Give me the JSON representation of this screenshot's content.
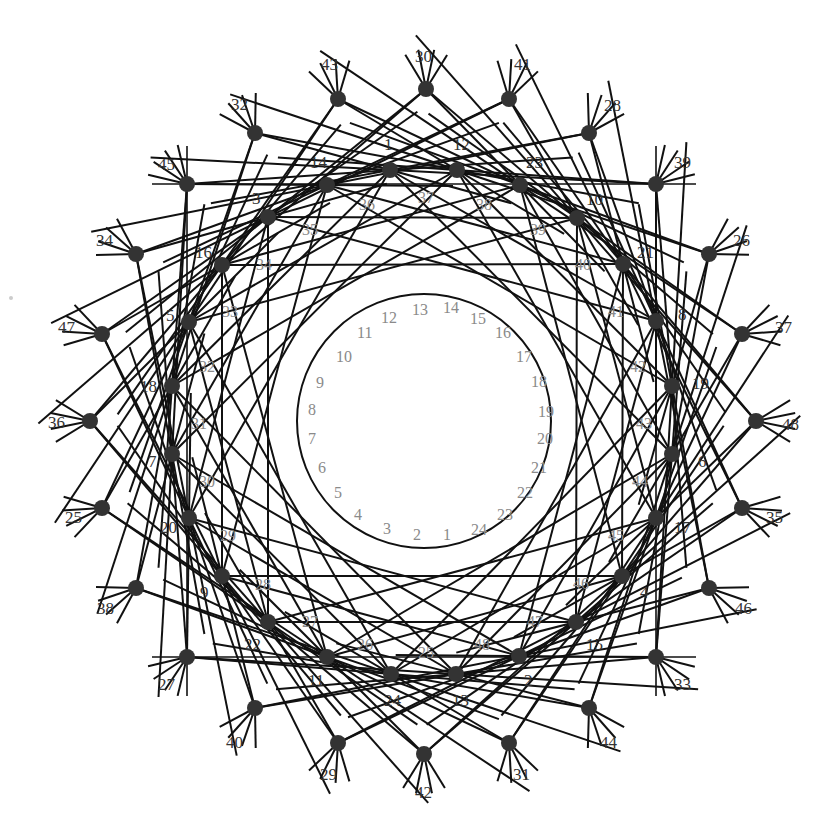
{
  "diagram": {
    "type": "line-arrangement",
    "center": [
      424,
      421
    ],
    "colors": {
      "line": "#111111",
      "dot": "#333333",
      "label": "#333333",
      "gray_label": "#8a8a8a",
      "background": "#ffffff"
    },
    "inner_circle": {
      "radius": 127
    },
    "outer_dots": [
      {
        "label": "30",
        "x": 426,
        "y": 89,
        "lx": 415,
        "ly": 62
      },
      {
        "label": "41",
        "x": 509,
        "y": 99,
        "lx": 514,
        "ly": 70
      },
      {
        "label": "28",
        "x": 589,
        "y": 133,
        "lx": 604,
        "ly": 111
      },
      {
        "label": "39",
        "x": 656,
        "y": 184,
        "lx": 674,
        "ly": 168
      },
      {
        "label": "26",
        "x": 709,
        "y": 254,
        "lx": 733,
        "ly": 246
      },
      {
        "label": "37",
        "x": 742,
        "y": 334,
        "lx": 775,
        "ly": 333
      },
      {
        "label": "48",
        "x": 756,
        "y": 421,
        "lx": 782,
        "ly": 430
      },
      {
        "label": "35",
        "x": 742,
        "y": 508,
        "lx": 766,
        "ly": 523
      },
      {
        "label": "46",
        "x": 709,
        "y": 588,
        "lx": 735,
        "ly": 614
      },
      {
        "label": "33",
        "x": 656,
        "y": 657,
        "lx": 674,
        "ly": 690
      },
      {
        "label": "44",
        "x": 589,
        "y": 708,
        "lx": 600,
        "ly": 748
      },
      {
        "label": "31",
        "x": 509,
        "y": 743,
        "lx": 513,
        "ly": 780
      },
      {
        "label": "42",
        "x": 424,
        "y": 754,
        "lx": 415,
        "ly": 798
      },
      {
        "label": "29",
        "x": 338,
        "y": 743,
        "lx": 320,
        "ly": 780
      },
      {
        "label": "40",
        "x": 255,
        "y": 708,
        "lx": 226,
        "ly": 748
      },
      {
        "label": "27",
        "x": 187,
        "y": 657,
        "lx": 158,
        "ly": 690
      },
      {
        "label": "38",
        "x": 136,
        "y": 588,
        "lx": 97,
        "ly": 614
      },
      {
        "label": "25",
        "x": 102,
        "y": 508,
        "lx": 65,
        "ly": 523
      },
      {
        "label": "36",
        "x": 90,
        "y": 421,
        "lx": 48,
        "ly": 428
      },
      {
        "label": "47",
        "x": 102,
        "y": 334,
        "lx": 58,
        "ly": 333
      },
      {
        "label": "34",
        "x": 136,
        "y": 254,
        "lx": 96,
        "ly": 246
      },
      {
        "label": "45",
        "x": 187,
        "y": 184,
        "lx": 158,
        "ly": 170
      },
      {
        "label": "32",
        "x": 255,
        "y": 133,
        "lx": 231,
        "ly": 110
      },
      {
        "label": "43",
        "x": 338,
        "y": 99,
        "lx": 321,
        "ly": 70
      }
    ],
    "middle_dots": [
      {
        "label": "1",
        "x": 390,
        "y": 170,
        "lx": 384,
        "ly": 150
      },
      {
        "label": "12",
        "x": 457,
        "y": 170,
        "lx": 453,
        "ly": 150
      },
      {
        "label": "23",
        "x": 520,
        "y": 185,
        "lx": 526,
        "ly": 168
      },
      {
        "label": "10",
        "x": 577,
        "y": 218,
        "lx": 586,
        "ly": 205
      },
      {
        "label": "21",
        "x": 623,
        "y": 264,
        "lx": 637,
        "ly": 258
      },
      {
        "label": "8",
        "x": 656,
        "y": 321,
        "lx": 678,
        "ly": 320
      },
      {
        "label": "19",
        "x": 672,
        "y": 386,
        "lx": 692,
        "ly": 389
      },
      {
        "label": "6",
        "x": 672,
        "y": 454,
        "lx": 698,
        "ly": 467
      },
      {
        "label": "17",
        "x": 656,
        "y": 518,
        "lx": 674,
        "ly": 533
      },
      {
        "label": "4",
        "x": 622,
        "y": 576,
        "lx": 640,
        "ly": 598
      },
      {
        "label": "15",
        "x": 576,
        "y": 622,
        "lx": 586,
        "ly": 650
      },
      {
        "label": "2",
        "x": 519,
        "y": 656,
        "lx": 524,
        "ly": 686
      },
      {
        "label": "13",
        "x": 456,
        "y": 674,
        "lx": 452,
        "ly": 706
      },
      {
        "label": "24",
        "x": 391,
        "y": 674,
        "lx": 384,
        "ly": 706
      },
      {
        "label": "11",
        "x": 327,
        "y": 657,
        "lx": 308,
        "ly": 686
      },
      {
        "label": "22",
        "x": 268,
        "y": 622,
        "lx": 244,
        "ly": 650
      },
      {
        "label": "9",
        "x": 222,
        "y": 576,
        "lx": 200,
        "ly": 598
      },
      {
        "label": "20",
        "x": 189,
        "y": 518,
        "lx": 160,
        "ly": 533
      },
      {
        "label": "7",
        "x": 172,
        "y": 454,
        "lx": 148,
        "ly": 467
      },
      {
        "label": "18",
        "x": 172,
        "y": 386,
        "lx": 140,
        "ly": 392
      },
      {
        "label": "5",
        "x": 189,
        "y": 322,
        "lx": 166,
        "ly": 321
      },
      {
        "label": "16",
        "x": 222,
        "y": 265,
        "lx": 195,
        "ly": 258
      },
      {
        "label": "3",
        "x": 268,
        "y": 217,
        "lx": 252,
        "ly": 204
      },
      {
        "label": "14",
        "x": 327,
        "y": 185,
        "lx": 310,
        "ly": 168
      }
    ],
    "gray_labels": [
      {
        "label": "37",
        "x": 418,
        "y": 203
      },
      {
        "label": "38",
        "x": 476,
        "y": 210
      },
      {
        "label": "39",
        "x": 530,
        "y": 235
      },
      {
        "label": "40",
        "x": 575,
        "y": 270
      },
      {
        "label": "41",
        "x": 608,
        "y": 317
      },
      {
        "label": "42",
        "x": 630,
        "y": 372
      },
      {
        "label": "43",
        "x": 636,
        "y": 429
      },
      {
        "label": "44",
        "x": 632,
        "y": 487
      },
      {
        "label": "45",
        "x": 608,
        "y": 541
      },
      {
        "label": "46",
        "x": 573,
        "y": 589
      },
      {
        "label": "47",
        "x": 527,
        "y": 627
      },
      {
        "label": "48",
        "x": 474,
        "y": 650
      },
      {
        "label": "25",
        "x": 418,
        "y": 658
      },
      {
        "label": "26",
        "x": 357,
        "y": 650
      },
      {
        "label": "27",
        "x": 302,
        "y": 627
      },
      {
        "label": "28",
        "x": 255,
        "y": 590
      },
      {
        "label": "29",
        "x": 220,
        "y": 541
      },
      {
        "label": "30",
        "x": 199,
        "y": 487
      },
      {
        "label": "31",
        "x": 191,
        "y": 429
      },
      {
        "label": "32",
        "x": 199,
        "y": 372
      },
      {
        "label": "33",
        "x": 222,
        "y": 317
      },
      {
        "label": "34",
        "x": 256,
        "y": 270
      },
      {
        "label": "35",
        "x": 302,
        "y": 235
      },
      {
        "label": "36",
        "x": 359,
        "y": 210
      }
    ],
    "inner_labels": [
      {
        "label": "13",
        "x": 412,
        "y": 315
      },
      {
        "label": "14",
        "x": 443,
        "y": 313
      },
      {
        "label": "15",
        "x": 470,
        "y": 324
      },
      {
        "label": "16",
        "x": 495,
        "y": 338
      },
      {
        "label": "17",
        "x": 516,
        "y": 362
      },
      {
        "label": "18",
        "x": 531,
        "y": 387
      },
      {
        "label": "19",
        "x": 538,
        "y": 417
      },
      {
        "label": "20",
        "x": 537,
        "y": 444
      },
      {
        "label": "21",
        "x": 531,
        "y": 473
      },
      {
        "label": "22",
        "x": 517,
        "y": 498
      },
      {
        "label": "23",
        "x": 497,
        "y": 520
      },
      {
        "label": "24",
        "x": 471,
        "y": 535
      },
      {
        "label": "1",
        "x": 443,
        "y": 540
      },
      {
        "label": "2",
        "x": 413,
        "y": 540
      },
      {
        "label": "3",
        "x": 383,
        "y": 534
      },
      {
        "label": "4",
        "x": 354,
        "y": 520
      },
      {
        "label": "5",
        "x": 334,
        "y": 498
      },
      {
        "label": "6",
        "x": 318,
        "y": 473
      },
      {
        "label": "7",
        "x": 308,
        "y": 444
      },
      {
        "label": "8",
        "x": 308,
        "y": 415
      },
      {
        "label": "9",
        "x": 316,
        "y": 388
      },
      {
        "label": "10",
        "x": 336,
        "y": 362
      },
      {
        "label": "11",
        "x": 357,
        "y": 338
      },
      {
        "label": "12",
        "x": 381,
        "y": 323
      }
    ],
    "frame_lines": [
      {
        "x1": 152,
        "y1": 184,
        "x2": 696,
        "y2": 184
      },
      {
        "x1": 152,
        "y1": 657,
        "x2": 696,
        "y2": 657
      },
      {
        "x1": 187,
        "y1": 146,
        "x2": 187,
        "y2": 696
      },
      {
        "x1": 656,
        "y1": 146,
        "x2": 656,
        "y2": 696
      }
    ],
    "stray_mark": {
      "x": 11,
      "y": 298
    }
  }
}
